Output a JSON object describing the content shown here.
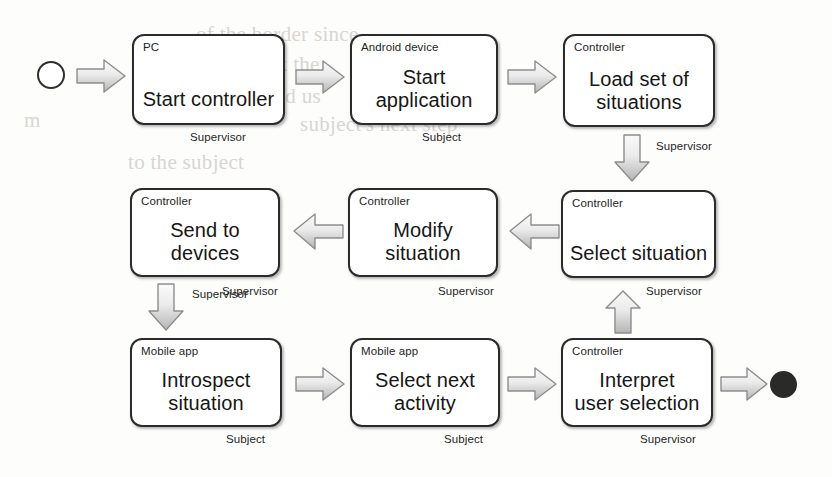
{
  "diagram": {
    "type": "flowchart",
    "start_node": "start-circle",
    "end_node": "end-circle",
    "colors": {
      "node_border": "#2b2b2b",
      "node_fill": "#ffffff",
      "arrow_fill_light": "#f2f2f2",
      "arrow_fill_dark": "#b9b9b9",
      "arrow_border": "#8a8a8a",
      "end_node_fill": "#2a2a2a",
      "text": "#161616"
    },
    "nodes": [
      {
        "id": "start-controller",
        "role": "PC",
        "title": "Start controller",
        "actor": "Supervisor"
      },
      {
        "id": "start-application",
        "role": "Android device",
        "title": "Start\napplication",
        "actor": "Subject"
      },
      {
        "id": "load-set-of-situations",
        "role": "Controller",
        "title": "Load set of\nsituations",
        "actor": "Supervisor"
      },
      {
        "id": "send-to-devices",
        "role": "Controller",
        "title": "Send to\ndevices",
        "actor": "Supervisor"
      },
      {
        "id": "modify-situation",
        "role": "Controller",
        "title": "Modify\nsituation",
        "actor": "Supervisor"
      },
      {
        "id": "select-situation",
        "role": "Controller",
        "title": "Select situation",
        "actor": "Supervisor"
      },
      {
        "id": "introspect-situation",
        "role": "Mobile app",
        "title": "Introspect\nsituation",
        "actor": "Subject"
      },
      {
        "id": "select-next-activity",
        "role": "Mobile app",
        "title": "Select next\nactivity",
        "actor": "Subject"
      },
      {
        "id": "interpret-user-selection",
        "role": "Controller",
        "title": "Interpret\nuser selection",
        "actor": "Supervisor"
      }
    ],
    "node_text": {
      "n1": {
        "role": "PC",
        "line1": "Start controller",
        "line2": "",
        "actor": "Supervisor"
      },
      "n2": {
        "role": "Android device",
        "line1": "Start",
        "line2": "application",
        "actor": "Subject"
      },
      "n3": {
        "role": "Controller",
        "line1": "Load set of",
        "line2": "situations",
        "actor": "Supervisor"
      },
      "n4": {
        "role": "Controller",
        "line1": "Send to",
        "line2": "devices",
        "actor": "Supervisor"
      },
      "n5": {
        "role": "Controller",
        "line1": "Modify",
        "line2": "situation",
        "actor": "Supervisor"
      },
      "n6": {
        "role": "Controller",
        "line1": "Select situation",
        "line2": "",
        "actor": "Supervisor"
      },
      "n7": {
        "role": "Mobile app",
        "line1": "Introspect",
        "line2": "situation",
        "actor": "Subject"
      },
      "n8": {
        "role": "Mobile app",
        "line1": "Select next",
        "line2": "activity",
        "actor": "Subject"
      },
      "n9": {
        "role": "Controller",
        "line1": "Interpret",
        "line2": "user selection",
        "actor": "Supervisor"
      }
    },
    "edges": [
      {
        "id": "edge-start-to-n1",
        "from": "start-circle",
        "to": "start-controller",
        "direction": "right"
      },
      {
        "id": "edge-n1-to-n2",
        "from": "start-controller",
        "to": "start-application",
        "direction": "right"
      },
      {
        "id": "edge-n2-to-n3",
        "from": "start-application",
        "to": "load-set-of-situations",
        "direction": "right"
      },
      {
        "id": "edge-n3-to-n6",
        "from": "load-set-of-situations",
        "to": "select-situation",
        "direction": "down"
      },
      {
        "id": "edge-n6-to-n5",
        "from": "select-situation",
        "to": "modify-situation",
        "direction": "left"
      },
      {
        "id": "edge-n5-to-n4",
        "from": "modify-situation",
        "to": "send-to-devices",
        "direction": "left"
      },
      {
        "id": "edge-n4-to-n7",
        "from": "send-to-devices",
        "to": "introspect-situation",
        "direction": "down"
      },
      {
        "id": "edge-n7-to-n8",
        "from": "introspect-situation",
        "to": "select-next-activity",
        "direction": "right"
      },
      {
        "id": "edge-n8-to-n9",
        "from": "select-next-activity",
        "to": "interpret-user-selection",
        "direction": "right"
      },
      {
        "id": "edge-n9-to-n6",
        "from": "interpret-user-selection",
        "to": "select-situation",
        "direction": "up"
      },
      {
        "id": "edge-n9-to-end",
        "from": "interpret-user-selection",
        "to": "end-circle",
        "direction": "right"
      }
    ],
    "edge_labels": {
      "e_n3_n6": "Supervisor",
      "e_n4_n7": "Supervisor",
      "e_n9_n6": "Supervisor"
    },
    "background_text": {
      "b1": "of the border since",
      "b2": "a check the",
      "b3": "n it would us",
      "b4": "m",
      "b5": "subject's next step",
      "b6": "to the subject"
    }
  }
}
